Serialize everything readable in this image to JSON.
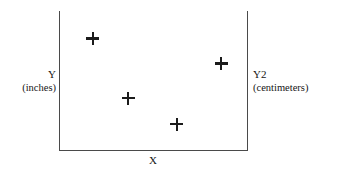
{
  "chart_data": {
    "type": "scatter",
    "title": "",
    "xlabel": "X",
    "ylabel": "Y",
    "ylabel_units": "(inches)",
    "y2label": "Y2",
    "y2label_units": "(centimeters)",
    "marker": "plus",
    "marker_color": "#1b1b1b",
    "grid": false,
    "legend": null,
    "xticks": [],
    "yticks": [],
    "axis_frame": "left-right-bottom",
    "axis_color": "#4a4a4a",
    "background": "#ffffff",
    "xlim": [
      0,
      1
    ],
    "ylim": [
      0,
      1
    ],
    "points": [
      {
        "x": 0.177,
        "y": 0.799
      },
      {
        "x": 0.866,
        "y": 0.619
      },
      {
        "x": 0.366,
        "y": 0.374
      },
      {
        "x": 0.629,
        "y": 0.187
      }
    ]
  },
  "labels": {
    "y_primary": "Y",
    "y_primary_units": "(inches)",
    "y_secondary": "Y2",
    "y_secondary_units": "(centimeters)",
    "x": "X"
  }
}
